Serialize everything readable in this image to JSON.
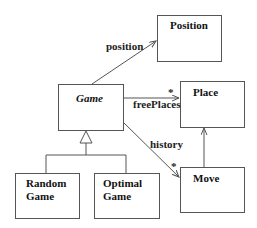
{
  "diagram": {
    "type": "uml-class-diagram",
    "classes": [
      {
        "id": "position",
        "name": "Position",
        "abstract": false
      },
      {
        "id": "game",
        "name": "Game",
        "abstract": true
      },
      {
        "id": "place",
        "name": "Place",
        "abstract": false
      },
      {
        "id": "move",
        "name": "Move",
        "abstract": false
      },
      {
        "id": "random_game",
        "name_line1": "Random",
        "name_line2": "Game",
        "abstract": false
      },
      {
        "id": "optimal_game",
        "name_line1": "Optimal",
        "name_line2": "Game",
        "abstract": false
      }
    ],
    "associations": [
      {
        "from": "Game",
        "to": "Position",
        "role": "position",
        "multiplicity": ""
      },
      {
        "from": "Game",
        "to": "Place",
        "role": "freePlaces",
        "multiplicity": "*"
      },
      {
        "from": "Game",
        "to": "Move",
        "role": "history",
        "multiplicity": "*"
      },
      {
        "from": "Move",
        "to": "Place",
        "role": "",
        "multiplicity": ""
      }
    ],
    "generalizations": [
      {
        "child": "Random Game",
        "parent": "Game"
      },
      {
        "child": "Optimal Game",
        "parent": "Game"
      }
    ],
    "labels": {
      "position": "position",
      "freePlaces": "freePlaces",
      "freePlaces_mult": "*",
      "history": "history",
      "history_mult": "*"
    }
  }
}
